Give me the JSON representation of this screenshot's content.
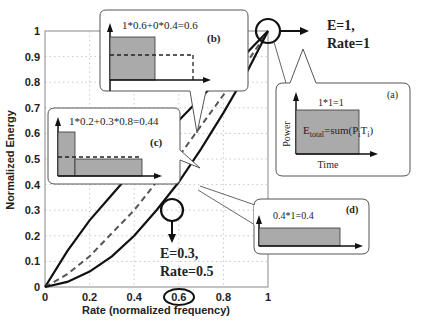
{
  "chart_data": {
    "type": "line",
    "title": "",
    "xlabel": "Rate (normalized frequency)",
    "ylabel": "Normalized Energy",
    "xlim": [
      0,
      1
    ],
    "ylim": [
      0,
      1
    ],
    "grid": true,
    "x_ticks": [
      "0",
      "0.2",
      "0.4",
      "0.6",
      "0.8",
      "1"
    ],
    "y_ticks": [
      "0",
      "0.1",
      "0.2",
      "0.3",
      "0.4",
      "0.5",
      "0.6",
      "0.7",
      "0.8",
      "0.9",
      "1"
    ],
    "highlighted_x_tick": "0.6",
    "x": [
      0,
      0.1,
      0.2,
      0.3,
      0.4,
      0.5,
      0.6,
      0.7,
      0.8,
      0.9,
      1.0
    ],
    "series": [
      {
        "name": "upper (solid)",
        "style": "solid",
        "values": [
          0,
          0.14,
          0.26,
          0.36,
          0.46,
          0.56,
          0.65,
          0.74,
          0.83,
          0.91,
          1.0
        ]
      },
      {
        "name": "middle (dashed)",
        "style": "dashed",
        "values": [
          0,
          0.05,
          0.12,
          0.21,
          0.3,
          0.41,
          0.51,
          0.63,
          0.75,
          0.87,
          1.0
        ]
      },
      {
        "name": "lower (solid)",
        "style": "solid",
        "values": [
          0,
          0.02,
          0.06,
          0.12,
          0.2,
          0.3,
          0.41,
          0.54,
          0.68,
          0.83,
          1.0
        ]
      }
    ],
    "annotations": [
      {
        "id": "top-point",
        "line1": "E=1,",
        "line2": "Rate=1"
      },
      {
        "id": "mid-point",
        "line1": "E=0.3,",
        "line2": "Rate=0.5"
      }
    ],
    "callouts": [
      {
        "id": "a",
        "tag": "(a)",
        "formula": "1*1=1",
        "equation_prefix": "E",
        "equation_sub": "total",
        "equation_rest": "=sum(P",
        "equation_sub2": "i",
        "equation_mid": "T",
        "equation_sub3": "i",
        "equation_end": ")",
        "y_label": "Power",
        "x_label": "Time"
      },
      {
        "id": "b",
        "tag": "(b)",
        "formula": "1*0.6+0*0.4=0.6"
      },
      {
        "id": "c",
        "tag": "(c)",
        "formula": "1*0.2+0.3*0.8=0.44"
      },
      {
        "id": "d",
        "tag": "(d)",
        "formula": "0.4*1=0.4"
      }
    ]
  }
}
